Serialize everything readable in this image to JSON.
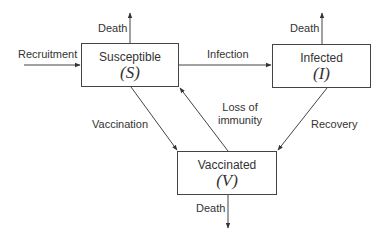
{
  "diagram": {
    "type": "compartment-flow",
    "nodes": [
      {
        "id": "S",
        "title": "Susceptible",
        "symbol": "(S)"
      },
      {
        "id": "I",
        "title": "Infected",
        "symbol": "(I)"
      },
      {
        "id": "V",
        "title": "Vaccinated",
        "symbol": "(V)"
      }
    ],
    "edges": [
      {
        "from": "external",
        "to": "S",
        "label": "Recruitment"
      },
      {
        "from": "S",
        "to": "external",
        "label": "Death"
      },
      {
        "from": "S",
        "to": "I",
        "label": "Infection"
      },
      {
        "from": "I",
        "to": "external",
        "label": "Death"
      },
      {
        "from": "S",
        "to": "V",
        "label": "Vaccination"
      },
      {
        "from": "V",
        "to": "S",
        "label": "Loss of immunity"
      },
      {
        "from": "I",
        "to": "V",
        "label": "Recovery"
      },
      {
        "from": "V",
        "to": "external",
        "label": "Death"
      }
    ],
    "labels": {
      "recruitment": "Recruitment",
      "death_s": "Death",
      "infection": "Infection",
      "death_i": "Death",
      "vaccination": "Vaccination",
      "loss_line1": "Loss of",
      "loss_line2": "immunity",
      "recovery": "Recovery",
      "death_v": "Death"
    },
    "colors": {
      "line": "#444444",
      "text": "#333333"
    }
  }
}
